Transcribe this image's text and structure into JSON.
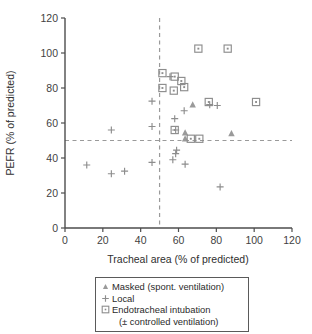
{
  "chart_data": {
    "type": "scatter",
    "title": "",
    "xlabel": "Tracheal area (% of predicted)",
    "ylabel": "PEFR (% of predicted)",
    "xlim": [
      0,
      120
    ],
    "ylim": [
      0,
      120
    ],
    "xticks": [
      0,
      20,
      40,
      60,
      80,
      100,
      120
    ],
    "yticks": [
      0,
      20,
      40,
      60,
      80,
      100,
      120
    ],
    "grid": false,
    "legend_position": "below-axes",
    "reference_lines": [
      {
        "orientation": "vertical",
        "value": 50,
        "style": "dashed"
      },
      {
        "orientation": "horizontal",
        "value": 50,
        "style": "dashed"
      }
    ],
    "series": [
      {
        "name": "Masked (spont. ventilation)",
        "marker": "triangle",
        "points": [
          {
            "x": 67.5,
            "y": 70.5
          },
          {
            "x": 63.5,
            "y": 54.5
          },
          {
            "x": 88.0,
            "y": 54.0
          },
          {
            "x": 63.5,
            "y": 51.0
          }
        ]
      },
      {
        "name": "Local",
        "marker": "plus",
        "points": [
          {
            "x": 24.5,
            "y": 56.0
          },
          {
            "x": 46.0,
            "y": 72.5
          },
          {
            "x": 46.0,
            "y": 58.0
          },
          {
            "x": 11.5,
            "y": 36.0
          },
          {
            "x": 24.5,
            "y": 31.0
          },
          {
            "x": 31.5,
            "y": 32.5
          },
          {
            "x": 46.0,
            "y": 37.5
          },
          {
            "x": 55.5,
            "y": 86.5
          },
          {
            "x": 63.0,
            "y": 67.0
          },
          {
            "x": 76.5,
            "y": 70.5
          },
          {
            "x": 80.5,
            "y": 70.0
          },
          {
            "x": 58.0,
            "y": 62.5
          },
          {
            "x": 58.5,
            "y": 56.0
          },
          {
            "x": 59.0,
            "y": 44.5
          },
          {
            "x": 58.5,
            "y": 42.5
          },
          {
            "x": 57.0,
            "y": 39.0
          },
          {
            "x": 63.5,
            "y": 36.5
          },
          {
            "x": 82.0,
            "y": 23.5
          }
        ]
      },
      {
        "name": "Endotracheal intubation (± controlled ventilation)",
        "marker": "square-dot",
        "points": [
          {
            "x": 51.5,
            "y": 88.5
          },
          {
            "x": 51.5,
            "y": 80.0
          },
          {
            "x": 58.0,
            "y": 86.5
          },
          {
            "x": 61.5,
            "y": 84.0
          },
          {
            "x": 70.5,
            "y": 102.5
          },
          {
            "x": 86.0,
            "y": 102.5
          },
          {
            "x": 57.5,
            "y": 78.5
          },
          {
            "x": 63.0,
            "y": 80.5
          },
          {
            "x": 76.0,
            "y": 72.0
          },
          {
            "x": 101.0,
            "y": 72.0
          },
          {
            "x": 58.0,
            "y": 56.0
          },
          {
            "x": 66.5,
            "y": 51.0
          },
          {
            "x": 71.0,
            "y": 51.0
          }
        ]
      }
    ]
  },
  "axis": {
    "x_label": "Tracheal area (% of predicted)",
    "y_label": "PEFR (% of predicted)",
    "x_ticks": [
      "0",
      "20",
      "40",
      "60",
      "80",
      "100",
      "120"
    ],
    "y_ticks": [
      "0",
      "20",
      "40",
      "60",
      "80",
      "100",
      "120"
    ]
  },
  "legend": {
    "items": [
      {
        "marker": "triangle",
        "label": "Masked (spont. ventilation)"
      },
      {
        "marker": "plus",
        "label": "Local"
      },
      {
        "marker": "square-dot",
        "label": "Endotracheal intubation"
      }
    ],
    "continuation": "(± controlled ventilation)"
  },
  "colors": {
    "marker": "#8d8d8d",
    "axis": "#4d4d4d",
    "reference_line": "#9a9a9a",
    "text": "#2b2b2b",
    "background": "#ffffff"
  }
}
